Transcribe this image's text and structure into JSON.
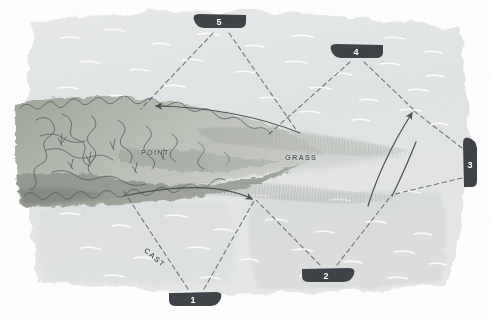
{
  "scene": {
    "title": "Fishing approach diagram over a weedy point",
    "medium": "hand-drawn watercolor and ink illustration",
    "canvas": {
      "width": 492,
      "height": 318
    },
    "background_color": "#ffffff",
    "water_color": "#e3e6e6",
    "water_deep_color": "#d6dadb",
    "weed_color": "#b9bdb6",
    "weed_dark_color": "#8f948c",
    "grass_color": "#a9ada6",
    "ink_color": "#4b4f54",
    "marker_color": "#3c4045",
    "marker_text_color": "#ffffff"
  },
  "labels": {
    "point": "POINT",
    "grass": "GRASS",
    "cast": "CAST"
  },
  "boats": [
    {
      "id": "boat-1",
      "number": "1",
      "x": 196,
      "y": 299,
      "rotation": 0,
      "heading": "right"
    },
    {
      "id": "boat-2",
      "number": "2",
      "x": 329,
      "y": 275,
      "rotation": 0,
      "heading": "right"
    },
    {
      "id": "boat-3",
      "number": "3",
      "x": 470,
      "y": 162,
      "rotation": -90,
      "heading": "up"
    },
    {
      "id": "boat-4",
      "number": "4",
      "x": 356,
      "y": 51,
      "rotation": 0,
      "heading": "left"
    },
    {
      "id": "boat-5",
      "number": "5",
      "x": 219,
      "y": 21,
      "rotation": 0,
      "heading": "left"
    }
  ],
  "cast_lines": [
    {
      "from": "boat-5",
      "to_x": 140,
      "to_y": 110,
      "style": "dashed"
    },
    {
      "from": "boat-5",
      "to_x": 298,
      "to_y": 132,
      "style": "dashed"
    },
    {
      "from": "boat-4",
      "to_x": 268,
      "to_y": 135,
      "style": "dashed"
    },
    {
      "from": "boat-4",
      "to_x": 414,
      "to_y": 110,
      "style": "dashed"
    },
    {
      "from": "boat-3",
      "to_x": 414,
      "to_y": 110,
      "style": "dashed"
    },
    {
      "from": "boat-3",
      "to_x": 390,
      "to_y": 196,
      "style": "dashed"
    },
    {
      "from": "boat-2",
      "to_x": 255,
      "to_y": 200,
      "style": "dashed"
    },
    {
      "from": "boat-2",
      "to_x": 390,
      "to_y": 196,
      "style": "dashed"
    },
    {
      "from": "boat-1",
      "to_x": 122,
      "to_y": 190,
      "style": "dashed",
      "label": "CAST"
    },
    {
      "from": "boat-1",
      "to_x": 255,
      "to_y": 200,
      "style": "dashed"
    }
  ],
  "sweep_arrows": [
    {
      "id": "sweep-upper",
      "direction": "leftward",
      "arrowhead": "left",
      "note": "arc above the point sweeping toward shore"
    },
    {
      "id": "sweep-lower",
      "direction": "rightward",
      "arrowhead": "right",
      "note": "arc below the point sweeping out"
    },
    {
      "id": "sweep-right",
      "direction": "up-left",
      "arrowhead": "up-left",
      "note": "arc from deep water toward grass edge"
    }
  ],
  "caption": ""
}
